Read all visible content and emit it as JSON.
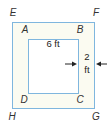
{
  "figure": {
    "outer_square": {
      "vertices": [
        "E",
        "F",
        "G",
        "H"
      ]
    },
    "inner_square": {
      "vertices": [
        "A",
        "B",
        "C",
        "D"
      ]
    },
    "vertex_labels": {
      "E": "E",
      "F": "F",
      "G": "G",
      "H": "H",
      "A": "A",
      "B": "B",
      "C": "C",
      "D": "D"
    },
    "dimensions": {
      "inner_side": "6 ft",
      "border_width_number": "2",
      "border_width_unit": "ft"
    },
    "colors": {
      "line": "#7fb6de",
      "border_fill": "#fbfbf1",
      "inner_fill": "#ffffff",
      "text": "#333333"
    }
  }
}
